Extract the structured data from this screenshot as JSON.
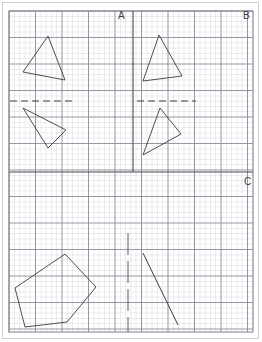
{
  "page": {
    "width": 262,
    "height": 342,
    "background_color": "#ffffff",
    "border_color": "#cfcfcf"
  },
  "grid": {
    "origin_x": 9,
    "origin_y": 11,
    "right": 253,
    "bottom": 332,
    "minor_spacing": 5.3,
    "major_every": 5,
    "minor_color": "#d6d8de",
    "major_color": "#8a8d96",
    "border_color": "#7b7e87",
    "minor_width": 0.5,
    "major_width": 0.9,
    "border_width": 1.0
  },
  "dividers": {
    "vertical": {
      "name": "panel-divider-vertical",
      "x": 133,
      "y1": 11,
      "y2": 172,
      "color": "#4a4a4a",
      "width": 1.1
    },
    "horizontal": {
      "name": "panel-divider-horizontal",
      "y": 172,
      "x1": 9,
      "x2": 253,
      "color": "#4a4a4a",
      "width": 1.1
    }
  },
  "labels": [
    {
      "id": "A",
      "text": "A",
      "x": 118,
      "y": 11
    },
    {
      "id": "B",
      "text": "B",
      "x": 243,
      "y": 11
    },
    {
      "id": "C",
      "text": "C",
      "x": 244,
      "y": 177
    }
  ],
  "panels": [
    {
      "name": "panel-a",
      "label": "A",
      "mirror_line": {
        "name": "mirror-line-a",
        "type": "dashed-horizontal",
        "x1": 10,
        "y1": 101,
        "x2": 72,
        "y2": 101,
        "dash": "7,4",
        "color": "#3c3c3c",
        "width": 1.2
      },
      "shapes": [
        {
          "name": "triangle-a-preimage",
          "type": "polygon",
          "points": "48,36 23,72 65,80",
          "color": "#3c3c3c",
          "width": 0.9
        },
        {
          "name": "triangle-a-image",
          "type": "polygon",
          "points": "23,108 66,130 48,148",
          "color": "#3c3c3c",
          "width": 0.9
        }
      ]
    },
    {
      "name": "panel-b",
      "label": "B",
      "mirror_line": {
        "name": "mirror-line-b",
        "type": "dashed-horizontal",
        "x1": 137,
        "y1": 101,
        "x2": 196,
        "y2": 101,
        "dash": "7,4",
        "color": "#3c3c3c",
        "width": 1.2
      },
      "shapes": [
        {
          "name": "triangle-b-preimage",
          "type": "polygon",
          "points": "159,35 143,81 182,76",
          "color": "#3c3c3c",
          "width": 0.9
        },
        {
          "name": "triangle-b-image",
          "type": "polygon",
          "points": "160,108 181,134 143,155",
          "color": "#3c3c3c",
          "width": 0.9
        }
      ]
    },
    {
      "name": "panel-c",
      "label": "C",
      "mirror_line": {
        "name": "mirror-line-c",
        "type": "dashed-vertical",
        "x1": 128,
        "y1": 233,
        "x2": 128,
        "y2": 332,
        "dash": "22,6",
        "color": "#5a5a5a",
        "width": 1.0
      },
      "shapes": [
        {
          "name": "pentagon-c",
          "type": "polygon",
          "points": "65,254 96,287 67,322 25,327 15,288",
          "color": "#3c3c3c",
          "width": 0.9
        },
        {
          "name": "segment-c",
          "type": "line",
          "points": "143,253 178,325",
          "color": "#3c3c3c",
          "width": 1.0
        }
      ]
    }
  ]
}
